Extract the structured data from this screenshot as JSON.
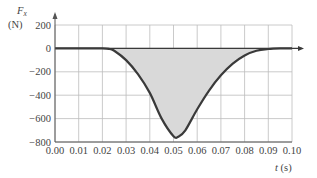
{
  "chart_data": {
    "type": "area",
    "title": "",
    "ylabel": "F_x",
    "ylabel_unit": "(N)",
    "xlabel": "t (s)",
    "xlim": [
      0.0,
      0.1
    ],
    "ylim": [
      -800,
      200
    ],
    "grid": true,
    "legend": null,
    "x_ticks": [
      "0.00",
      "0.01",
      "0.02",
      "0.03",
      "0.04",
      "0.05",
      "0.06",
      "0.07",
      "0.08",
      "0.09",
      "0.10"
    ],
    "y_ticks": [
      "200",
      "0",
      "−200",
      "−400",
      "−600",
      "−800"
    ],
    "series": [
      {
        "name": "F_x(t)",
        "fill": "shaded area between curve and zero",
        "x": [
          0.0,
          0.01,
          0.02,
          0.023,
          0.025,
          0.03,
          0.035,
          0.04,
          0.045,
          0.05,
          0.052,
          0.055,
          0.06,
          0.065,
          0.07,
          0.075,
          0.08,
          0.085,
          0.09,
          0.095,
          0.1
        ],
        "values": [
          0,
          0,
          0,
          -5,
          -20,
          -100,
          -220,
          -380,
          -600,
          -750,
          -755,
          -700,
          -520,
          -360,
          -230,
          -130,
          -60,
          -20,
          -5,
          0,
          0
        ]
      }
    ]
  },
  "colors": {
    "curve": "#3a3a3a",
    "fill": "#d9d9d9",
    "grid": "#bdbdbd",
    "axis": "#555555",
    "text": "#444444"
  }
}
